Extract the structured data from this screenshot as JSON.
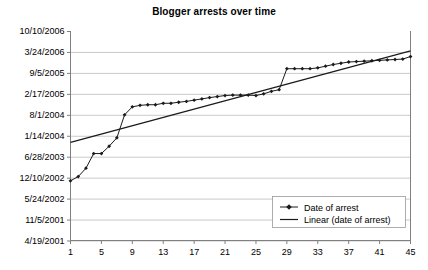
{
  "chart_data": {
    "type": "line",
    "title": "Blogger arrests over time",
    "xlabel": "",
    "ylabel": "",
    "grid": true,
    "legend_position": "bottom-right",
    "x": [
      1,
      2,
      3,
      4,
      5,
      6,
      7,
      8,
      9,
      10,
      11,
      12,
      13,
      14,
      15,
      16,
      17,
      18,
      19,
      20,
      21,
      22,
      23,
      24,
      25,
      26,
      27,
      28,
      29,
      30,
      31,
      32,
      33,
      34,
      35,
      36,
      37,
      38,
      39,
      40,
      41,
      42,
      43,
      44,
      45
    ],
    "xlim": [
      1,
      45
    ],
    "xticks": [
      1,
      5,
      9,
      13,
      17,
      21,
      25,
      29,
      33,
      37,
      41,
      45
    ],
    "xtick_labels": [
      "1",
      "5",
      "9",
      "13",
      "17",
      "21",
      "25",
      "29",
      "33",
      "37",
      "41",
      "45"
    ],
    "ylim": [
      "4/19/2001",
      "10/10/2006"
    ],
    "yticks": [
      "4/19/2001",
      "11/5/2001",
      "5/24/2002",
      "12/10/2002",
      "6/28/2003",
      "1/14/2004",
      "8/1/2004",
      "2/17/2005",
      "9/5/2005",
      "3/24/2006",
      "10/10/2006"
    ],
    "ytick_labels": [
      "10/10/2006",
      "3/24/2006",
      "9/5/2005",
      "2/17/2005",
      "8/1/2004",
      "1/14/2004",
      "6/28/2003",
      "12/10/2002",
      "5/24/2002",
      "11/5/2001",
      "4/19/2001"
    ],
    "series": [
      {
        "name": "Date of arrest",
        "type": "line-marker",
        "marker": "diamond",
        "color": "#1a1a1a",
        "values": [
          "1/9/2003",
          "2/20/2003",
          "5/6/2003",
          "9/27/2003",
          "9/27/2003",
          "12/5/2003",
          "3/2/2004",
          "9/20/2004",
          "12/8/2004",
          "12/18/2004",
          "12/24/2004",
          "12/24/2004",
          "1/3/2005",
          "1/3/2005",
          "1/12/2005",
          "1/19/2005",
          "1/28/2005",
          "2/5/2005",
          "2/14/2005",
          "2/21/2005",
          "2/26/2005",
          "2/28/2005",
          "2/28/2005",
          "2/28/2005",
          "2/26/2005",
          "3/6/2005",
          "3/24/2005",
          "4/2/2005",
          "9/5/2005",
          "9/5/2005",
          "9/5/2005",
          "9/5/2005",
          "9/10/2005",
          "9/24/2005",
          "10/6/2005",
          "10/13/2005",
          "10/20/2005",
          "10/22/2005",
          "10/24/2005",
          "10/26/2005",
          "10/28/2005",
          "10/30/2005",
          "11/1/2005",
          "11/3/2005",
          "11/20/2005"
        ],
        "y_frac": [
          0.285,
          0.305,
          0.345,
          0.415,
          0.415,
          0.45,
          0.49,
          0.6,
          0.638,
          0.645,
          0.648,
          0.648,
          0.655,
          0.655,
          0.66,
          0.664,
          0.67,
          0.676,
          0.682,
          0.687,
          0.692,
          0.694,
          0.694,
          0.694,
          0.692,
          0.7,
          0.712,
          0.72,
          0.82,
          0.82,
          0.82,
          0.82,
          0.824,
          0.832,
          0.84,
          0.846,
          0.852,
          0.854,
          0.856,
          0.858,
          0.86,
          0.862,
          0.864,
          0.866,
          0.878
        ]
      },
      {
        "name": "Linear (date of arrest)",
        "type": "trendline",
        "color": "#1a1a1a",
        "start_value": "2/1/2004",
        "end_value": "3/24/2006",
        "y_frac_start": 0.468,
        "y_frac_end": 0.905
      }
    ],
    "legend": [
      "Date of arrest",
      "Linear (date of arrest)"
    ]
  },
  "colors": {
    "background": "#ffffff",
    "gridline": "#b3b3b3",
    "axis": "#808080",
    "data": "#1a1a1a",
    "text": "#000000"
  }
}
